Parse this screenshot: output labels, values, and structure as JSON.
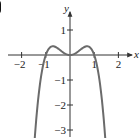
{
  "panel": {
    "label": "(b)"
  },
  "chart_data": {
    "type": "line",
    "title": "",
    "xlabel": "x",
    "ylabel": "y",
    "x_ticks": [
      -2,
      -1,
      1,
      2
    ],
    "x_tick_labels": [
      "−2",
      "−1",
      "1",
      "2"
    ],
    "y_ticks": [
      1,
      -1,
      -2,
      -3
    ],
    "y_tick_labels": [
      "1",
      "−1",
      "−2",
      "−3"
    ],
    "xlim": [
      -2.5,
      2.7
    ],
    "ylim": [
      -3.3,
      2.2
    ],
    "grid": false,
    "legend": null,
    "series": [
      {
        "name": "f(x)",
        "description": "quartic-shaped curve, local min at origin, maxima near x=±0.7 (y≈0.35), x-intercepts at 0 and ±1, falls to −∞ on both ends (arrowheads)",
        "x": [
          -1.55,
          -1.4,
          -1.2,
          -1.0,
          -0.85,
          -0.7,
          -0.5,
          -0.3,
          0,
          0.3,
          0.5,
          0.7,
          0.85,
          1.0,
          1.2,
          1.4,
          1.55
        ],
        "y": [
          -3.3,
          -2.63,
          -0.89,
          0,
          0.28,
          0.35,
          0.26,
          0.11,
          0,
          0.11,
          0.26,
          0.35,
          0.28,
          0,
          -0.89,
          -2.63,
          -3.3
        ]
      }
    ],
    "colors": {
      "curve": "#6b6b6b",
      "axes": "#333333"
    }
  }
}
